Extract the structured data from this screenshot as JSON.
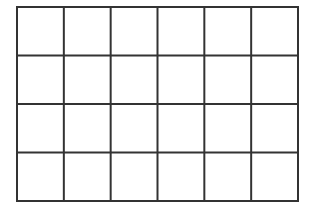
{
  "grid": {
    "rows": 4,
    "cols": 6,
    "left": 17,
    "top": 7,
    "right": 298,
    "bottom": 201,
    "line_color": "#333333",
    "line_width": 2,
    "background": "#ffffff"
  }
}
